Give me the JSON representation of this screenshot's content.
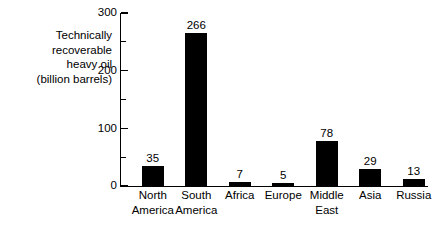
{
  "chart_data": {
    "type": "bar",
    "title": "",
    "xlabel": "",
    "ylabel": "Technically recoverable heavy oil (billion barrels)",
    "ylabel_lines": [
      "Technically",
      "recoverable",
      "heavy oil",
      "(billion barrels)"
    ],
    "categories": [
      "North America",
      "South America",
      "Africa",
      "Europe",
      "Middle East",
      "Asia",
      "Russia"
    ],
    "category_lines": [
      [
        "North",
        "America"
      ],
      [
        "South",
        "America"
      ],
      [
        "Africa"
      ],
      [
        "Europe"
      ],
      [
        "Middle",
        "East"
      ],
      [
        "Asia"
      ],
      [
        "Russia"
      ]
    ],
    "values": [
      35,
      266,
      7,
      5,
      78,
      29,
      13
    ],
    "value_labels": [
      "35",
      "266",
      "7",
      "5",
      "78",
      "29",
      "13"
    ],
    "ylim": [
      0,
      300
    ],
    "yticks": [
      0,
      100,
      200,
      300
    ],
    "ytick_labels": [
      "0",
      "100",
      "200",
      "300"
    ],
    "yticks_minor": [
      50,
      150,
      250
    ],
    "grid": false,
    "legend": false,
    "bar_color": "#000000",
    "background_color": "#ffffff",
    "axis_color": "#000000"
  }
}
